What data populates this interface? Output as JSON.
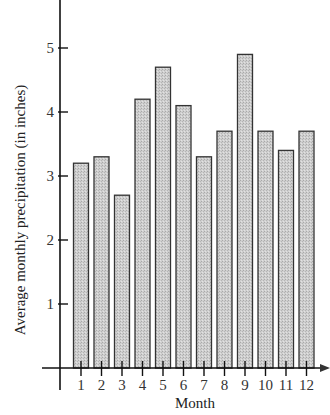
{
  "chart_data": {
    "type": "bar",
    "title": "",
    "xlabel": "Month",
    "ylabel": "Average monthly precipitation (in inches)",
    "categories": [
      "1",
      "2",
      "3",
      "4",
      "5",
      "6",
      "7",
      "8",
      "9",
      "10",
      "11",
      "12"
    ],
    "values": [
      3.2,
      3.3,
      2.7,
      4.2,
      4.7,
      4.1,
      3.3,
      3.7,
      4.9,
      3.7,
      3.4,
      3.7
    ],
    "yticks": [
      1,
      2,
      3,
      4,
      5
    ],
    "ylim": [
      0,
      5.7
    ],
    "grid": false,
    "legend": null,
    "bar_color": "#c8c8c8",
    "edge_color": "#333333"
  }
}
